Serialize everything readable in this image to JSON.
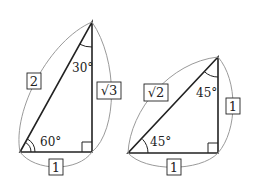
{
  "diagram": {
    "triangle_30_60_90": {
      "hypotenuse_label": "2",
      "vertical_leg_label": "√3",
      "base_label": "1",
      "top_angle": "30°",
      "bottom_left_angle": "60°"
    },
    "triangle_45_45_90": {
      "hypotenuse_label": "√2",
      "vertical_leg_label": "1",
      "base_label": "1",
      "top_angle": "45°",
      "bottom_left_angle": "45°"
    },
    "colors": {
      "line": "#222222",
      "arc": "#9a9a9a"
    }
  }
}
